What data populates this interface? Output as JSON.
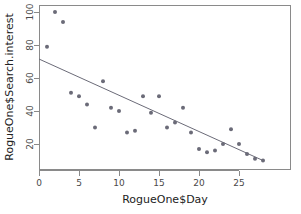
{
  "chart_data": {
    "type": "scatter",
    "title": "",
    "xlabel": "RogueOne$Day",
    "ylabel": "RogueOne$Search.interest",
    "xlim": [
      -0.4,
      29.0
    ],
    "ylim": [
      6.0,
      103.0
    ],
    "grid": false,
    "legend": null,
    "xticks": [
      0,
      5,
      10,
      15,
      20,
      25
    ],
    "yticks": [
      20,
      40,
      60,
      80,
      100
    ],
    "xtick_labels": [
      "0",
      "5",
      "10",
      "15",
      "20",
      "25"
    ],
    "ytick_labels": [
      "20",
      "40",
      "60",
      "80",
      "100"
    ],
    "x": [
      1,
      2,
      3,
      4,
      5,
      6,
      7,
      8,
      9,
      10,
      11,
      12,
      13,
      14,
      15,
      16,
      17,
      18,
      19,
      20,
      21,
      22,
      23,
      24,
      25,
      26,
      27,
      28
    ],
    "y": [
      79,
      100,
      94,
      51,
      49,
      44,
      30,
      58,
      42,
      40,
      27,
      28,
      49,
      39,
      49,
      30,
      33,
      42,
      27,
      17,
      15,
      16,
      20,
      29,
      20,
      14,
      11,
      10
    ],
    "point_color": "#6b6b78",
    "point_size": 2.0,
    "annotations": [],
    "series": [
      {
        "name": "Search interest",
        "type": "scatter",
        "x": [
          1,
          2,
          3,
          4,
          5,
          6,
          7,
          8,
          9,
          10,
          11,
          12,
          13,
          14,
          15,
          16,
          17,
          18,
          19,
          20,
          21,
          22,
          23,
          24,
          25,
          26,
          27,
          28
        ],
        "values": [
          79,
          100,
          94,
          51,
          49,
          44,
          30,
          58,
          42,
          40,
          27,
          28,
          49,
          39,
          49,
          30,
          33,
          42,
          27,
          17,
          15,
          16,
          20,
          29,
          20,
          14,
          11,
          10
        ]
      },
      {
        "name": "Linear fit",
        "type": "line",
        "x": [
          0,
          28
        ],
        "values": [
          71.5,
          10.0
        ],
        "color": "#6b6b78"
      }
    ],
    "fit_line": {
      "x_start": 0,
      "y_start": 71.5,
      "x_end": 28,
      "y_end": 10.0,
      "slope": -2.196,
      "intercept": 71.5
    }
  }
}
